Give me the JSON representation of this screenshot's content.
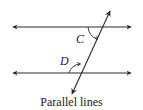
{
  "figure": {
    "caption": "Parallel lines",
    "labels": {
      "angle_c": "C",
      "angle_d": "D"
    },
    "colors": {
      "stroke": "#2a2a2a",
      "text": "#222222",
      "background": "#ffffff"
    },
    "elements": {
      "parallel_lines": [
        {
          "name": "top-line",
          "y": 27,
          "x1": 12,
          "x2": 132,
          "arrows": "both"
        },
        {
          "name": "bottom-line",
          "y": 73,
          "x1": 12,
          "x2": 132,
          "arrows": "both"
        }
      ],
      "transversal": {
        "x1": 110,
        "y1": 11,
        "x2": 72,
        "y2": 94,
        "arrows": "both"
      },
      "angles": [
        {
          "label": "C",
          "position": "below top line, left of transversal"
        },
        {
          "label": "D",
          "position": "above bottom line, left of transversal"
        }
      ]
    }
  }
}
